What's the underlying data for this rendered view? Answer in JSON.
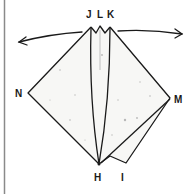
{
  "diagram": {
    "type": "origami-fold-step",
    "labels": {
      "J": "J",
      "L": "L",
      "K": "K",
      "N": "N",
      "M": "M",
      "H": "H",
      "I": "I"
    },
    "arrows": [
      {
        "name": "left-arrow",
        "direction": "left"
      },
      {
        "name": "right-arrow",
        "direction": "right"
      }
    ],
    "colors": {
      "stroke": "#1a1a1a",
      "paper": "#f7f7f5",
      "border": "#8a8a8a",
      "speckle": "#b0b0b0"
    }
  }
}
